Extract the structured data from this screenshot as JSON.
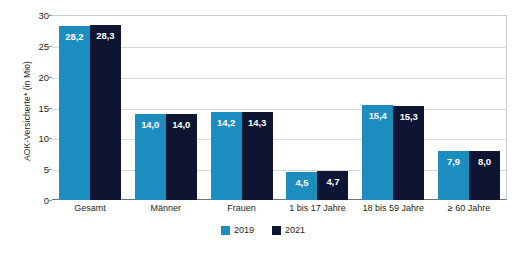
{
  "chart_data": {
    "type": "bar",
    "title": "",
    "xlabel": "",
    "ylabel": "AOK-Versicherte* (in Mio)",
    "ylim": [
      0,
      30
    ],
    "yticks": [
      "0",
      "5",
      "10",
      "15",
      "20",
      "25",
      "30"
    ],
    "grid": true,
    "legend_position": "bottom-center",
    "categories": [
      "Gesamt",
      "Männer",
      "Frauen",
      "1 bis 17 Jahre",
      "18 bis 59 Jahre",
      "≥ 60 Jahre"
    ],
    "series": [
      {
        "name": "2019",
        "color": "#1b8dbe",
        "values": [
          28.2,
          14.0,
          14.2,
          4.5,
          15.4,
          7.9
        ],
        "labels": [
          "28,2",
          "14,0",
          "14,2",
          "4,5",
          "15,4",
          "7,9"
        ]
      },
      {
        "name": "2021",
        "color": "#0d1533",
        "values": [
          28.3,
          14.0,
          14.3,
          4.7,
          15.3,
          8.0
        ],
        "labels": [
          "28,3",
          "14,0",
          "14,3",
          "4,7",
          "15,3",
          "8,0"
        ]
      }
    ]
  },
  "legend": {
    "items": [
      {
        "label": "2019",
        "color": "#1b8dbe"
      },
      {
        "label": "2021",
        "color": "#0d1533"
      }
    ]
  },
  "footnote": {
    "text": ""
  }
}
